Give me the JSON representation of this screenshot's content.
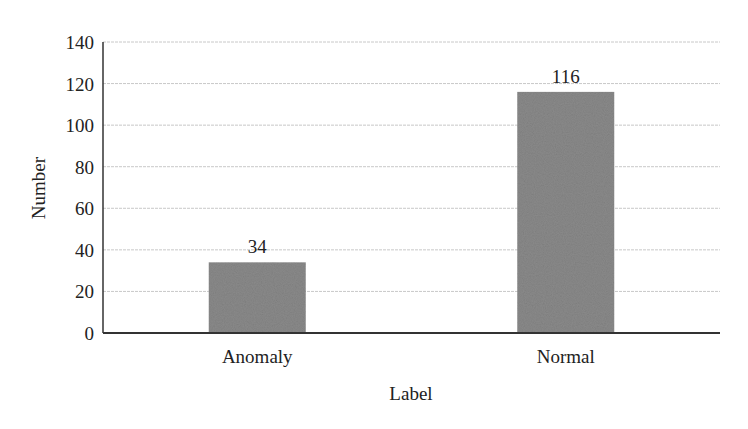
{
  "chart_data": {
    "type": "bar",
    "title": "",
    "xlabel": "Label",
    "ylabel": "Number",
    "categories": [
      "Anomaly",
      "Normal"
    ],
    "values": [
      34,
      116
    ],
    "data_labels": [
      "34",
      "116"
    ],
    "ylim": [
      0,
      140
    ],
    "yticks": [
      0,
      20,
      40,
      60,
      80,
      100,
      120,
      140
    ],
    "ytick_labels": [
      "0",
      "20",
      "40",
      "60",
      "80",
      "100",
      "120",
      "140"
    ],
    "grid": true,
    "legend": null,
    "bar_color": "#8a8a8a"
  },
  "colors": {
    "bar": "#8a8a8a",
    "axis": "#333333",
    "grid": "#c8c8c8",
    "text": "#222222"
  }
}
